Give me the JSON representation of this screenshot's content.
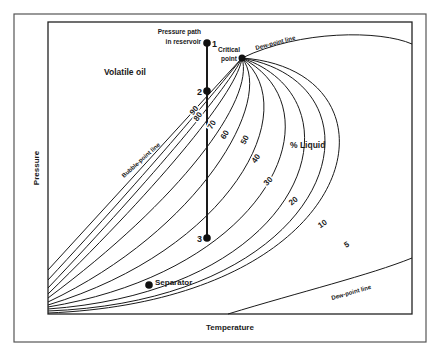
{
  "diagram": {
    "title": "Volatile oil",
    "xlabel": "Temperature",
    "ylabel": "Pressure",
    "region_label": "% Liquid",
    "annotations": {
      "pressure_path": [
        "Pressure path",
        "in reservoir"
      ],
      "critical_point": [
        "Critical",
        "point"
      ],
      "bubble_point_line": "Bubble-point line",
      "dew_point_line_top": "Dew-point line",
      "dew_point_line_bottom": "Dew-point line",
      "separator": "Separator"
    },
    "path_points": [
      {
        "id": "1",
        "label": "1"
      },
      {
        "id": "2",
        "label": "2"
      },
      {
        "id": "3",
        "label": "3"
      }
    ],
    "quality_lines": [
      {
        "percent": 90,
        "label": "90"
      },
      {
        "percent": 80,
        "label": "80"
      },
      {
        "percent": 70,
        "label": "70"
      },
      {
        "percent": 60,
        "label": "60"
      },
      {
        "percent": 50,
        "label": "50"
      },
      {
        "percent": 40,
        "label": "40"
      },
      {
        "percent": 30,
        "label": "30"
      },
      {
        "percent": 20,
        "label": "20"
      },
      {
        "percent": 10,
        "label": "10"
      },
      {
        "percent": 5,
        "label": "5"
      }
    ],
    "colors": {
      "ink": "#1a1a1a",
      "frame": "#555555",
      "background": "#ffffff"
    }
  }
}
